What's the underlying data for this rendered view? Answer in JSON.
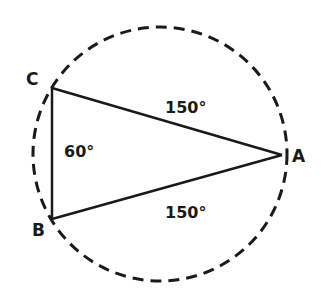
{
  "diagram": {
    "colors": {
      "stroke": "#1a1a1a",
      "background": "#ffffff"
    },
    "circle": {
      "cx": 160,
      "cy": 154,
      "r": 127,
      "style": "dashed"
    },
    "vertices": {
      "A": {
        "label": "A",
        "x": 282,
        "y": 155
      },
      "B": {
        "label": "B",
        "x": 52,
        "y": 219
      },
      "C": {
        "label": "C",
        "x": 52,
        "y": 88
      }
    },
    "arc_labels": {
      "CA": "150°",
      "AB": "150°",
      "BC": "60°"
    }
  }
}
